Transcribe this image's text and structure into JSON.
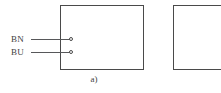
{
  "figure": {
    "caption_a": "a)",
    "background_color": "#ffffff",
    "line_color": "#4a4a4a",
    "wire_color": "#57585a",
    "text_color": "#3f3f3f"
  },
  "wires": [
    {
      "label": "BN",
      "name": "brown-wire"
    },
    {
      "label": "BU",
      "name": "blue-wire"
    }
  ],
  "terminals": [
    {
      "name": "terminal-bn"
    },
    {
      "name": "terminal-bu"
    }
  ],
  "boxes": [
    {
      "name": "device-enclosure-a"
    },
    {
      "name": "device-enclosure-b"
    }
  ]
}
